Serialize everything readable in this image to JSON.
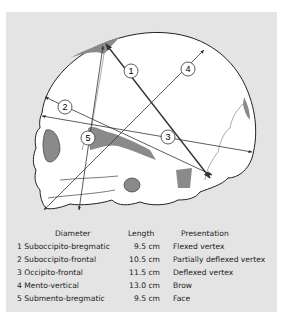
{
  "figure": {
    "type": "fetal-skull-lateral-diagram",
    "background": "#e4e4e4",
    "skull_fill": "#ffffff",
    "bone_shade": "#8a8a8a",
    "line_color": "#333333"
  },
  "markers": [
    {
      "id": "1",
      "label": "1"
    },
    {
      "id": "2",
      "label": "2"
    },
    {
      "id": "3",
      "label": "3"
    },
    {
      "id": "4",
      "label": "4"
    },
    {
      "id": "5",
      "label": "5"
    }
  ],
  "legend": {
    "headers": {
      "diameter": "Diameter",
      "length": "Length",
      "presentation": "Presentation"
    },
    "rows": [
      {
        "diameter": "1 Suboccipito-bregmatic",
        "length": "9.5 cm",
        "presentation": "Flexed vertex"
      },
      {
        "diameter": "2 Suboccipito-frontal",
        "length": "10.5 cm",
        "presentation": "Partially deflexed vertex"
      },
      {
        "diameter": "3 Occipito-frontal",
        "length": "11.5 cm",
        "presentation": "Deflexed vertex"
      },
      {
        "diameter": "4 Mento-vertical",
        "length": "13.0 cm",
        "presentation": "Brow"
      },
      {
        "diameter": "5 Submento-bregmatic",
        "length": "9.5 cm",
        "presentation": "Face"
      }
    ]
  }
}
